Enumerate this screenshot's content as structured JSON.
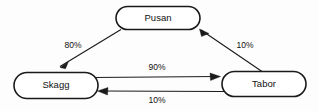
{
  "diagram": {
    "type": "state-transition-graph",
    "background_color": "#fdfdfd",
    "line_color": "#1a1a1a",
    "text_color": "#111111",
    "nodes": [
      {
        "id": "pusan",
        "label": "Pusan"
      },
      {
        "id": "skagg",
        "label": "Skagg"
      },
      {
        "id": "tabor",
        "label": "Tabor"
      }
    ],
    "edges": [
      {
        "id": "pusan-skagg",
        "from": "Pusan",
        "to": "Skagg",
        "label": "80%"
      },
      {
        "id": "tabor-pusan",
        "from": "Tabor",
        "to": "Pusan",
        "label": "10%"
      },
      {
        "id": "skagg-tabor",
        "from": "Skagg",
        "to": "Tabor",
        "label": "90%"
      },
      {
        "id": "tabor-skagg",
        "from": "Tabor",
        "to": "Skagg",
        "label": "10%"
      }
    ]
  }
}
